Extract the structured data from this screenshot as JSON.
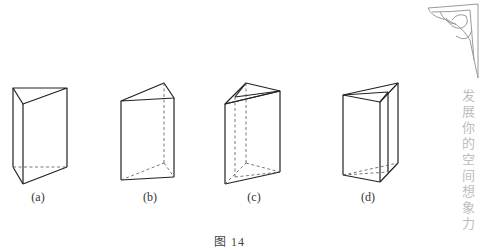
{
  "figures": [
    {
      "label": "(a)"
    },
    {
      "label": "(b)"
    },
    {
      "label": "(c)"
    },
    {
      "label": "(d)"
    }
  ],
  "caption": "图 14",
  "side_text": "发展你的空间想象力",
  "ornament": "corner-ornament",
  "colors": {
    "line": "#222222",
    "side_text": "#bdbdbd"
  }
}
